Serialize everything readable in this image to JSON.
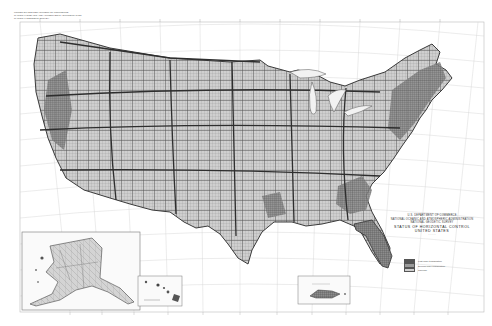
{
  "map": {
    "title": "STATUS OF HORIZONTAL CONTROL",
    "subtitle": "UNITED STATES",
    "agency_lines": [
      "U.S. DEPARTMENT OF COMMERCE",
      "NATIONAL OCEANIC AND ATMOSPHERIC ADMINISTRATION",
      "NATIONAL GEODETIC SURVEY"
    ],
    "date_line": "· · · ·",
    "header_note_lines": [
      "UNITED STATES DEPARTMENT OF COMMERCE",
      "NATIONAL OCEANIC AND ATMOSPHERIC ADMINISTRATION",
      "NATIONAL GEODETIC SURVEY"
    ],
    "legend": [
      {
        "label": "First-order triangulation",
        "color": "#555555"
      },
      {
        "label": "Second-order triangulation",
        "color": "#9a9a9a"
      },
      {
        "label": "Traverse",
        "color": "#cfcfcf"
      }
    ],
    "insets": [
      {
        "name": "Alaska"
      },
      {
        "name": "Hawaii"
      },
      {
        "name": "Puerto Rico"
      }
    ],
    "bottom_caption": "· · · · · · · ·",
    "bottom_right_caption": "· · · · ·",
    "colors": {
      "paper": "#ffffff",
      "graticule": "#c8c8c8",
      "land_fill": "#bdbdbd",
      "network_dark": "#3a3a3a",
      "network_mid": "#707070"
    }
  }
}
